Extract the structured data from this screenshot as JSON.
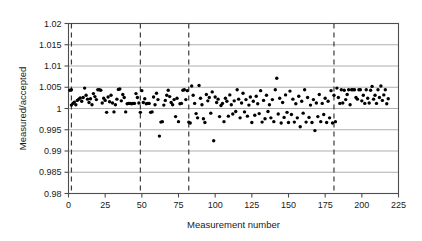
{
  "chart_data": {
    "type": "scatter",
    "title": "",
    "xlabel": "Measurement number",
    "ylabel": "Measured/accepted",
    "xlim": [
      0,
      225
    ],
    "ylim": [
      0.98,
      1.02
    ],
    "xticks": [
      0,
      25,
      50,
      75,
      100,
      125,
      150,
      175,
      200,
      225
    ],
    "xtick_labels": [
      "0",
      "25",
      "50",
      "75",
      "100",
      "125",
      "150",
      "175",
      "200",
      "225"
    ],
    "yticks": [
      0.98,
      0.985,
      0.99,
      0.995,
      1,
      1.005,
      1.01,
      1.015,
      1.02
    ],
    "ytick_labels": [
      "0.98",
      "0.985",
      "0.99",
      "0.995",
      "1",
      "1.005",
      "1.01",
      "1.015",
      "1.02"
    ],
    "grid": "horizontal",
    "grid_color": "#9a9a9a",
    "frame_color": "#4d4d4d",
    "marker_color": "#000000",
    "marker_size": 1.7,
    "legend": "none",
    "vertical_dashed_lines": [
      2,
      49,
      82,
      181
    ],
    "vline_color": "#3a3a3a",
    "x": [
      1,
      2,
      2,
      3,
      4,
      5,
      6,
      7,
      8,
      9,
      10,
      11,
      12,
      13,
      14,
      15,
      16,
      17,
      18,
      19,
      20,
      21,
      22,
      23,
      24,
      25,
      26,
      27,
      28,
      29,
      30,
      31,
      32,
      33,
      34,
      35,
      36,
      37,
      38,
      39,
      40,
      41,
      42,
      43,
      44,
      45,
      46,
      47,
      48,
      49,
      50,
      51,
      52,
      53,
      54,
      55,
      56,
      57,
      58,
      59,
      60,
      61,
      62,
      63,
      64,
      65,
      66,
      67,
      68,
      69,
      70,
      71,
      72,
      73,
      74,
      75,
      76,
      77,
      78,
      79,
      80,
      81,
      82,
      83,
      84,
      85,
      86,
      87,
      88,
      89,
      90,
      91,
      92,
      93,
      94,
      95,
      96,
      97,
      98,
      99,
      100,
      101,
      102,
      103,
      104,
      105,
      106,
      107,
      108,
      109,
      110,
      111,
      112,
      113,
      114,
      115,
      116,
      117,
      118,
      119,
      120,
      121,
      122,
      123,
      124,
      125,
      126,
      127,
      128,
      129,
      130,
      131,
      132,
      133,
      134,
      135,
      136,
      137,
      138,
      139,
      140,
      141,
      142,
      143,
      144,
      145,
      146,
      147,
      148,
      149,
      150,
      151,
      152,
      153,
      154,
      155,
      156,
      157,
      158,
      159,
      160,
      161,
      162,
      163,
      164,
      165,
      166,
      167,
      168,
      169,
      170,
      171,
      172,
      173,
      174,
      175,
      176,
      177,
      178,
      179,
      180,
      181,
      182,
      183,
      184,
      185,
      186,
      187,
      188,
      189,
      190,
      191,
      192,
      193,
      194,
      195,
      196,
      197,
      198,
      199,
      200,
      201,
      202,
      203,
      204,
      205,
      206,
      207,
      208,
      209,
      210,
      211,
      212,
      213,
      214,
      215,
      216,
      217,
      218
    ],
    "y": [
      1.0043,
      1.0044,
      1.0008,
      1.0012,
      1.0015,
      1.0009,
      1.0019,
      1.0022,
      1.0025,
      1.0017,
      1.0026,
      1.0048,
      1.0031,
      1.0022,
      1.0014,
      1.0023,
      1.0009,
      1.0035,
      1.0028,
      1.0021,
      1.0044,
      1.0044,
      1.0043,
      1.0013,
      1.0024,
      1.0019,
      0.9991,
      1.0027,
      1.0016,
      1.0031,
      1.0013,
      0.9992,
      1.0009,
      1.0022,
      1.0045,
      1.0046,
      1.0018,
      1.0033,
      1.0026,
      0.9992,
      1.0011,
      1.0012,
      1.0012,
      1.0011,
      1.0012,
      1.0012,
      1.0035,
      1.0026,
      1.0013,
      0.9991,
      1.0042,
      1.0014,
      1.0023,
      1.0011,
      1.0012,
      1.0012,
      0.9991,
      0.9992,
      1.0027,
      1.0009,
      1.0036,
      1.0021,
      0.9935,
      0.9968,
      0.9969,
      1.0008,
      1.0019,
      1.0031,
      1.0043,
      1.0028,
      1.0014,
      1.0009,
      1.0021,
      0.9981,
      1.0024,
      0.9969,
      1.0011,
      1.0012,
      1.0043,
      1.0044,
      1.0021,
      1.0042,
      0.9968,
      0.9966,
      1.0053,
      1.0031,
      1.0012,
      0.9988,
      0.9978,
      1.0054,
      1.0024,
      1.0009,
      0.9976,
      0.9967,
      1.0033,
      1.0018,
      1.0026,
      0.9989,
      1.0039,
      0.9924,
      1.0027,
      1.0014,
      1.0022,
      0.9981,
      1.0007,
      1.0012,
      0.9969,
      1.0024,
      1.0017,
      0.9982,
      1.0032,
      1.0009,
      0.9987,
      1.0018,
      0.9993,
      1.0044,
      1.0022,
      0.9978,
      1.0013,
      1.0036,
      0.9992,
      1.0021,
      0.9982,
      1.0008,
      1.0027,
      0.9967,
      1.0017,
      0.9984,
      1.0029,
      1.0011,
      0.9988,
      1.0042,
      0.9968,
      1.0019,
      0.9976,
      1.0031,
      0.9993,
      1.0009,
      0.9978,
      1.0021,
      0.9969,
      1.0044,
      1.0071,
      0.9987,
      1.0024,
      0.9966,
      1.0014,
      0.9979,
      1.0032,
      0.9991,
      0.9967,
      1.0041,
      0.9986,
      1.0022,
      0.9968,
      1.0011,
      0.9978,
      1.0029,
      0.9957,
      1.0017,
      0.9989,
      1.0044,
      0.9968,
      1.0026,
      0.9979,
      1.0008,
      0.9967,
      1.0021,
      0.9948,
      1.0013,
      0.9981,
      1.0033,
      0.9969,
      1.0012,
      0.9986,
      1.0024,
      0.9967,
      1.0017,
      0.9978,
      1.0042,
      0.9966,
      1.0031,
      0.9969,
      1.0048,
      1.0026,
      1.0012,
      1.0044,
      1.0013,
      1.0043,
      1.0021,
      1.0033,
      1.0044,
      1.0009,
      1.0044,
      1.0044,
      1.0044,
      1.0026,
      1.0022,
      1.0044,
      1.0044,
      1.0018,
      1.0031,
      1.0012,
      1.0044,
      1.0024,
      1.0013,
      1.0043,
      1.0052,
      1.0022,
      1.0031,
      1.0012,
      1.0044,
      1.0026,
      1.0053,
      1.0019,
      1.0032,
      1.0044,
      1.0011,
      1.0023,
      1.0042,
      1.0031,
      1.0053,
      1.0021,
      1.0013
    ]
  }
}
